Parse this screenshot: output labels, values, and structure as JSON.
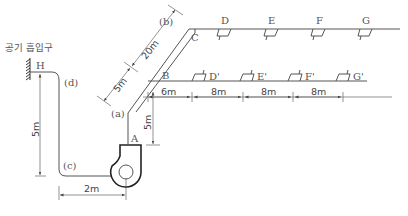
{
  "diagram": {
    "inlet_label": "공기 흡입구",
    "points": {
      "H": "H",
      "A": "A",
      "B": "B",
      "C": "C",
      "a": "(a)",
      "b": "(b)",
      "c": "(c)",
      "d": "(d)"
    },
    "outlets_upper": [
      "D",
      "E",
      "F",
      "G"
    ],
    "outlets_lower": [
      "D'",
      "E'",
      "F'",
      "G'"
    ],
    "dimensions": {
      "inlet_vertical": "5m",
      "inlet_horizontal": "2m",
      "riser_A": "5m",
      "diag_lower": "5m",
      "diag_upper": "20m",
      "B_to_D": "6m",
      "D_to_E": "8m",
      "E_to_F": "8m",
      "F_to_G": "8m"
    }
  }
}
